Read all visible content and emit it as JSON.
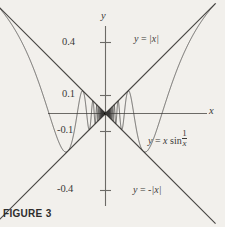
{
  "figure": {
    "caption": "FIGURE 3",
    "background_color": "#f2f0ec",
    "ink_color": "#3b3a38"
  },
  "chart_data": {
    "type": "line",
    "title": "",
    "subtitle": "",
    "xlabel": "x",
    "ylabel": "y",
    "xlim": [
      -0.62,
      0.62
    ],
    "ylim": [
      -0.62,
      0.62
    ],
    "grid": false,
    "legend": "inline-annotations",
    "x_tick_labels": [],
    "y_tick_labels": [
      "0.4",
      "0.1",
      "-0.1",
      "-0.4"
    ],
    "y_tick_values": [
      0.4,
      0.1,
      -0.1,
      -0.4
    ],
    "annotations": [
      {
        "name": "upper-envelope-label",
        "text_plain": "y = |x|",
        "x": 0.16,
        "y": 0.41
      },
      {
        "name": "oscillating-curve-label",
        "text_plain": "y = x sin 1/x",
        "x": 0.33,
        "y": -0.15
      },
      {
        "name": "lower-envelope-label",
        "text_plain": "y = -|x|",
        "x": 0.21,
        "y": -0.45
      }
    ],
    "series": [
      {
        "name": "y = |x|",
        "kind": "envelope-upper",
        "equation_parts": {
          "lhs": "y",
          "eq": "=",
          "rhs_abs": "|x|"
        },
        "color": "#4a4845",
        "x": [
          -0.62,
          0.0,
          0.62
        ],
        "values": [
          0.62,
          0.0,
          0.62
        ]
      },
      {
        "name": "y = -|x|",
        "kind": "envelope-lower",
        "equation_parts": {
          "lhs": "y",
          "eq": "=",
          "neg": "-",
          "rhs_abs": "|x|"
        },
        "color": "#4a4845",
        "x": [
          -0.62,
          0.0,
          0.62
        ],
        "values": [
          -0.62,
          0.0,
          -0.62
        ]
      },
      {
        "name": "y = x sin 1/x",
        "kind": "oscillating",
        "equation_parts": {
          "lhs": "y",
          "eq": "=",
          "coef": "x",
          "fn": "sin",
          "frac_num": "1",
          "frac_den": "x"
        },
        "color": "#3b3a38",
        "formula": "x*sin(1/x)",
        "sample_count": 4000,
        "note": "touches y=|x| and y=-|x| at tangency points; oscillates infinitely near x=0"
      }
    ]
  },
  "axes": {
    "x_axis": {
      "name": "x-axis",
      "label": "x"
    },
    "y_axis": {
      "name": "y-axis",
      "label": "y"
    }
  }
}
